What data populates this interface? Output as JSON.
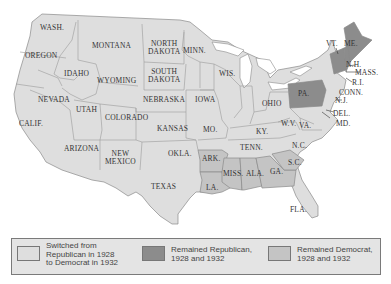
{
  "colors": {
    "switched": "#dedede",
    "republican": "#8c8c8c",
    "democrat": "#c4c4c4",
    "water": "#ffffff",
    "border": "#8a8a8a"
  },
  "states": {
    "wash": "WASH.",
    "oregon": "OREGON",
    "calif": "CALIF.",
    "idaho": "IDAHO",
    "nevada": "NEVADA",
    "montana": "MONTANA",
    "wyoming": "WYOMING",
    "utah": "UTAH",
    "arizona": "ARIZONA",
    "colorado": "COLORADO",
    "new_mexico_1": "NEW",
    "new_mexico_2": "MEXICO",
    "north_dakota_1": "NORTH",
    "north_dakota_2": "DAKOTA",
    "south_dakota_1": "SOUTH",
    "south_dakota_2": "DAKOTA",
    "nebraska": "NEBRASKA",
    "kansas": "KANSAS",
    "okla": "OKLA.",
    "texas": "TEXAS",
    "minn": "MINN.",
    "iowa": "IOWA",
    "mo": "MO.",
    "ark": "ARK.",
    "la": "LA.",
    "wis": "WIS.",
    "ohio": "OHIO",
    "ky": "KY.",
    "tenn": "TENN.",
    "miss": "MISS.",
    "ala": "ALA.",
    "ga": "GA.",
    "fla": "FLA.",
    "sc": "S.C.",
    "nc": "N.C.",
    "va": "VA.",
    "wv": "W.V.",
    "pa": "PA.",
    "md": "MD.",
    "del": "DEL.",
    "nj": "N.J.",
    "conn": "CONN.",
    "ri": "R.I.",
    "mass": "MASS.",
    "nh": "N.H.",
    "vt": "VT.",
    "me": "ME."
  },
  "legend": {
    "items": [
      {
        "label_1": "Switched from",
        "label_2": "Republican in 1928",
        "label_3": "to Democrat in 1932",
        "color": "#dedede"
      },
      {
        "label_1": "Remained Republican,",
        "label_2": "1928 and 1932",
        "color": "#8c8c8c"
      },
      {
        "label_1": "Remained Democrat,",
        "label_2": "1928 and 1932",
        "color": "#c4c4c4"
      }
    ]
  }
}
